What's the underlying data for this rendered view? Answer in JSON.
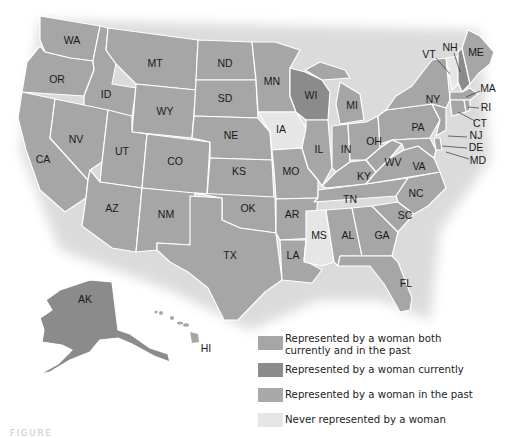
{
  "legend": {
    "items": [
      {
        "key": "both",
        "label_line1": "Represented by a woman both",
        "label_line2": "currently and in the past",
        "color": "#a6a6a6"
      },
      {
        "key": "current",
        "label_line1": "Represented by a woman currently",
        "label_line2": "",
        "color": "#8b8b8b"
      },
      {
        "key": "past",
        "label_line1": "Represented by a woman in the past",
        "label_line2": "",
        "color": "#a9a9a9"
      },
      {
        "key": "never",
        "label_line1": "Never represented by a woman",
        "label_line2": "",
        "color": "#e6e6e6"
      }
    ]
  },
  "states": {
    "WA": "WA",
    "OR": "OR",
    "CA": "CA",
    "ID": "ID",
    "NV": "NV",
    "MT": "MT",
    "WY": "WY",
    "UT": "UT",
    "AZ": "AZ",
    "CO": "CO",
    "NM": "NM",
    "ND": "ND",
    "SD": "SD",
    "NE": "NE",
    "KS": "KS",
    "OK": "OK",
    "TX": "TX",
    "MN": "MN",
    "IA": "IA",
    "MO": "MO",
    "AR": "AR",
    "LA": "LA",
    "WI": "WI",
    "IL": "IL",
    "MI": "MI",
    "IN": "IN",
    "OH": "OH",
    "KY": "KY",
    "TN": "TN",
    "MS": "MS",
    "AL": "AL",
    "GA": "GA",
    "FL": "FL",
    "SC": "SC",
    "NC": "NC",
    "VA": "VA",
    "WV": "WV",
    "PA": "PA",
    "NY": "NY",
    "VT": "VT",
    "NH": "NH",
    "ME": "ME",
    "MA": "MA",
    "RI": "RI",
    "CT": "CT",
    "NJ": "NJ",
    "DE": "DE",
    "MD": "MD",
    "AK": "AK",
    "HI": "HI"
  },
  "status_colors": {
    "never_states": [
      "IA",
      "MS",
      "VT"
    ],
    "current_states": [
      "WI",
      "NH",
      "AK"
    ]
  },
  "caption": "FIGURE"
}
